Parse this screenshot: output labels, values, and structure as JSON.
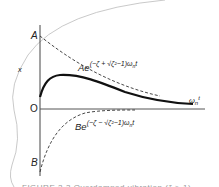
{
  "figure": {
    "axis_labels": {
      "y": "x",
      "x_main": "ω",
      "x_sub": "n",
      "x_tail": "t",
      "origin": "O",
      "start_top": "A",
      "start_bottom": "B"
    },
    "curves": {
      "upper": {
        "coef": "Ae",
        "exponent": "(−ζ + √ζ²−1)ω",
        "exponent_sub": "n",
        "exponent_tail": "t"
      },
      "lower": {
        "coef": "Be",
        "exponent": "(−ζ − √ζ²−1)ω",
        "exponent_sub": "n",
        "exponent_tail": "t"
      }
    },
    "caption": "FIGURE 2-3 Overdamped vibration (ζ > 1)",
    "colors": {
      "curve": "#111111",
      "dashed": "#333333",
      "axis": "#444444",
      "page_edge": "#bbbbbb"
    }
  }
}
